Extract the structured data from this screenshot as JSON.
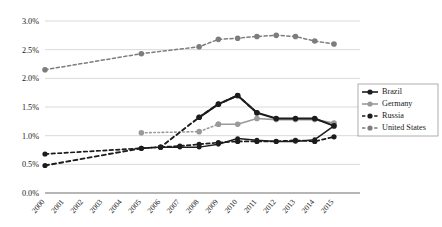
{
  "chart_data": {
    "type": "line",
    "title": "",
    "subtitle": "",
    "xlabel": "",
    "ylabel": "",
    "categories": [
      "2000",
      "2001",
      "2002",
      "2003",
      "2004",
      "2005",
      "2006",
      "2007",
      "2008",
      "2009",
      "2010",
      "2011",
      "2012",
      "2013",
      "2014",
      "2015"
    ],
    "x_tick_labels": [
      "2000",
      "2001",
      "2002",
      "2003",
      "2004",
      "2005",
      "2006",
      "2007",
      "2008",
      "2009",
      "2010",
      "2011",
      "2012",
      "2013",
      "2014",
      "2015"
    ],
    "y_tick_labels": [
      "0.0%",
      "0.5%",
      "1.0%",
      "1.5%",
      "2.0%",
      "2.5%",
      "3.0%"
    ],
    "y_tick_values": [
      0.0,
      0.5,
      1.0,
      1.5,
      2.0,
      2.5,
      3.0
    ],
    "ylim": [
      0.0,
      3.0
    ],
    "xlim": [
      "2000",
      "2015"
    ],
    "grid": true,
    "grid_axis": "y",
    "legend_position": "right-middle",
    "series": [
      {
        "name": "Brazil",
        "color": "#1c1c1c",
        "line_style": "solid",
        "marker": "circle",
        "x": [
          "2006",
          "2007",
          "2008",
          "2009",
          "2010",
          "2011",
          "2012",
          "2013",
          "2014",
          "2015"
        ],
        "values": [
          0.8,
          0.8,
          0.8,
          0.85,
          0.95,
          0.92,
          0.9,
          0.9,
          0.93,
          1.17
        ]
      },
      {
        "name": "Germany",
        "color": "#9a9a9a",
        "line_style": "solid",
        "marker": "circle",
        "x": [
          "2009",
          "2010",
          "2011",
          "2012",
          "2013",
          "2014",
          "2015"
        ],
        "values": [
          1.2,
          1.2,
          1.3,
          1.28,
          1.28,
          1.28,
          1.22
        ]
      },
      {
        "name": "Russia",
        "color": "#1c1c1c",
        "line_style": "dashed",
        "marker": "circle",
        "x": [
          "2000",
          "2005",
          "2006",
          "2008",
          "2009",
          "2010",
          "2011"
        ],
        "values": [
          0.48,
          0.78,
          0.8,
          1.32,
          1.55,
          1.7,
          1.4
        ]
      },
      {
        "name": "United States",
        "color": "#7d7d7d",
        "line_style": "dashed",
        "marker": "circle",
        "x": [
          "2000",
          "2005",
          "2008",
          "2009",
          "2010",
          "2011",
          "2012",
          "2013",
          "2014",
          "2015"
        ],
        "values": [
          2.15,
          2.43,
          2.55,
          2.68,
          2.7,
          2.73,
          2.75,
          2.73,
          2.65,
          2.6
        ]
      }
    ],
    "legend_entries": [
      {
        "label": "Brazil",
        "color": "#1c1c1c",
        "line_style": "solid"
      },
      {
        "label": "Germany",
        "color": "#9a9a9a",
        "line_style": "solid"
      },
      {
        "label": "Russia",
        "color": "#1c1c1c",
        "line_style": "dashed"
      },
      {
        "label": "United States",
        "color": "#7d7d7d",
        "line_style": "dashed"
      }
    ]
  },
  "overlay_series": {
    "russia_tail": {
      "name": "Russia",
      "color": "#1c1c1c",
      "line_style": "dashed",
      "x": [
        "2000",
        "2005",
        "2006",
        "2007",
        "2008",
        "2009",
        "2010",
        "2011",
        "2012",
        "2013",
        "2014",
        "2015"
      ],
      "values": [
        0.68,
        0.78,
        0.8,
        0.82,
        0.85,
        0.88,
        0.9,
        0.9,
        0.9,
        0.92,
        0.9,
        0.98
      ]
    },
    "brazil_main": {
      "name": "Brazil",
      "color": "#1c1c1c",
      "line_style": "solid",
      "x": [
        "2008",
        "2009",
        "2010",
        "2011",
        "2012",
        "2013",
        "2014",
        "2015"
      ],
      "values": [
        1.32,
        1.55,
        1.7,
        1.4,
        1.3,
        1.3,
        1.3,
        1.17
      ]
    },
    "germany_dotted": {
      "name": "Germany",
      "color": "#9a9a9a",
      "line_style": "dotted",
      "x": [
        "2005",
        "2008",
        "2009"
      ],
      "values": [
        1.05,
        1.07,
        1.2
      ]
    }
  }
}
